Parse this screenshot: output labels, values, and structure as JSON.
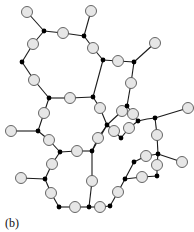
{
  "figure": {
    "label": "(b)"
  },
  "colors": {
    "edge": "#1a1a1a",
    "open_node_fill": "#e6e6e6",
    "open_node_stroke": "#555555",
    "junction": "#000000"
  },
  "nodes": {
    "junctions": [
      [
        44,
        31
      ],
      [
        84,
        36
      ],
      [
        22,
        62
      ],
      [
        49,
        98
      ],
      [
        93,
        97
      ],
      [
        103,
        60
      ],
      [
        134,
        62
      ],
      [
        38,
        131
      ],
      [
        60,
        152
      ],
      [
        92,
        151
      ],
      [
        45,
        179
      ],
      [
        59,
        207
      ],
      [
        89,
        207
      ],
      [
        107,
        125
      ],
      [
        127,
        106
      ],
      [
        138,
        121
      ],
      [
        121,
        138
      ],
      [
        155,
        118
      ],
      [
        158,
        154
      ],
      [
        134,
        162
      ],
      [
        157,
        176
      ],
      [
        125,
        179
      ],
      [
        110,
        206
      ]
    ],
    "open": [
      [
        27,
        12
      ],
      [
        63,
        33
      ],
      [
        91,
        11
      ],
      [
        93,
        48
      ],
      [
        33,
        44
      ],
      [
        34,
        80
      ],
      [
        70,
        98
      ],
      [
        44,
        113
      ],
      [
        118,
        61
      ],
      [
        155,
        43
      ],
      [
        131,
        83
      ],
      [
        188,
        108
      ],
      [
        11,
        131
      ],
      [
        49,
        140
      ],
      [
        77,
        151
      ],
      [
        52,
        164
      ],
      [
        21,
        178
      ],
      [
        51,
        193
      ],
      [
        75,
        207
      ],
      [
        92,
        181
      ],
      [
        100,
        108
      ],
      [
        122,
        111
      ],
      [
        133,
        114
      ],
      [
        129,
        128
      ],
      [
        114,
        131
      ],
      [
        98,
        138
      ],
      [
        157,
        135
      ],
      [
        182,
        162
      ],
      [
        146,
        156
      ],
      [
        157,
        165
      ],
      [
        142,
        177
      ],
      [
        118,
        192
      ],
      [
        100,
        207
      ]
    ]
  },
  "edges": [
    [
      [
        27,
        12
      ],
      [
        44,
        31
      ]
    ],
    [
      [
        44,
        31
      ],
      [
        63,
        33
      ]
    ],
    [
      [
        63,
        33
      ],
      [
        84,
        36
      ]
    ],
    [
      [
        84,
        36
      ],
      [
        91,
        11
      ]
    ],
    [
      [
        84,
        36
      ],
      [
        93,
        48
      ]
    ],
    [
      [
        93,
        48
      ],
      [
        103,
        60
      ]
    ],
    [
      [
        103,
        60
      ],
      [
        118,
        61
      ]
    ],
    [
      [
        118,
        61
      ],
      [
        134,
        62
      ]
    ],
    [
      [
        134,
        62
      ],
      [
        155,
        43
      ]
    ],
    [
      [
        134,
        62
      ],
      [
        131,
        83
      ]
    ],
    [
      [
        131,
        83
      ],
      [
        127,
        106
      ]
    ],
    [
      [
        44,
        31
      ],
      [
        33,
        44
      ]
    ],
    [
      [
        33,
        44
      ],
      [
        22,
        62
      ]
    ],
    [
      [
        22,
        62
      ],
      [
        34,
        80
      ]
    ],
    [
      [
        34,
        80
      ],
      [
        49,
        98
      ]
    ],
    [
      [
        49,
        98
      ],
      [
        70,
        98
      ]
    ],
    [
      [
        70,
        98
      ],
      [
        93,
        97
      ]
    ],
    [
      [
        93,
        97
      ],
      [
        103,
        60
      ]
    ],
    [
      [
        49,
        98
      ],
      [
        44,
        113
      ]
    ],
    [
      [
        44,
        113
      ],
      [
        38,
        131
      ]
    ],
    [
      [
        11,
        131
      ],
      [
        38,
        131
      ]
    ],
    [
      [
        38,
        131
      ],
      [
        49,
        140
      ]
    ],
    [
      [
        49,
        140
      ],
      [
        60,
        152
      ]
    ],
    [
      [
        60,
        152
      ],
      [
        77,
        151
      ]
    ],
    [
      [
        77,
        151
      ],
      [
        92,
        151
      ]
    ],
    [
      [
        60,
        152
      ],
      [
        52,
        164
      ]
    ],
    [
      [
        52,
        164
      ],
      [
        45,
        179
      ]
    ],
    [
      [
        21,
        178
      ],
      [
        45,
        179
      ]
    ],
    [
      [
        45,
        179
      ],
      [
        51,
        193
      ]
    ],
    [
      [
        51,
        193
      ],
      [
        59,
        207
      ]
    ],
    [
      [
        59,
        207
      ],
      [
        75,
        207
      ]
    ],
    [
      [
        75,
        207
      ],
      [
        89,
        207
      ]
    ],
    [
      [
        89,
        207
      ],
      [
        92,
        181
      ]
    ],
    [
      [
        92,
        181
      ],
      [
        92,
        151
      ]
    ],
    [
      [
        89,
        207
      ],
      [
        100,
        207
      ]
    ],
    [
      [
        100,
        207
      ],
      [
        110,
        206
      ]
    ],
    [
      [
        110,
        206
      ],
      [
        118,
        192
      ]
    ],
    [
      [
        118,
        192
      ],
      [
        125,
        179
      ]
    ],
    [
      [
        125,
        179
      ],
      [
        142,
        177
      ]
    ],
    [
      [
        142,
        177
      ],
      [
        157,
        176
      ]
    ],
    [
      [
        157,
        176
      ],
      [
        157,
        165
      ]
    ],
    [
      [
        157,
        165
      ],
      [
        158,
        154
      ]
    ],
    [
      [
        158,
        154
      ],
      [
        182,
        162
      ]
    ],
    [
      [
        158,
        154
      ],
      [
        146,
        156
      ]
    ],
    [
      [
        146,
        156
      ],
      [
        134,
        162
      ]
    ],
    [
      [
        134,
        162
      ],
      [
        125,
        179
      ]
    ],
    [
      [
        158,
        154
      ],
      [
        157,
        135
      ]
    ],
    [
      [
        157,
        135
      ],
      [
        155,
        118
      ]
    ],
    [
      [
        155,
        118
      ],
      [
        188,
        108
      ]
    ],
    [
      [
        155,
        118
      ],
      [
        147,
        119
      ]
    ],
    [
      [
        147,
        119
      ],
      [
        138,
        121
      ]
    ],
    [
      [
        93,
        97
      ],
      [
        100,
        108
      ]
    ],
    [
      [
        100,
        108
      ],
      [
        107,
        125
      ]
    ],
    [
      [
        107,
        125
      ],
      [
        92,
        151
      ]
    ],
    [
      [
        107,
        125
      ],
      [
        122,
        111
      ]
    ],
    [
      [
        122,
        111
      ],
      [
        127,
        106
      ]
    ],
    [
      [
        127,
        106
      ],
      [
        133,
        114
      ]
    ],
    [
      [
        133,
        114
      ],
      [
        138,
        121
      ]
    ],
    [
      [
        138,
        121
      ],
      [
        129,
        128
      ]
    ],
    [
      [
        129,
        128
      ],
      [
        121,
        138
      ]
    ],
    [
      [
        121,
        138
      ],
      [
        114,
        131
      ]
    ],
    [
      [
        114,
        131
      ],
      [
        107,
        125
      ]
    ],
    [
      [
        107,
        125
      ],
      [
        98,
        138
      ]
    ],
    [
      [
        98,
        138
      ],
      [
        92,
        151
      ]
    ]
  ]
}
